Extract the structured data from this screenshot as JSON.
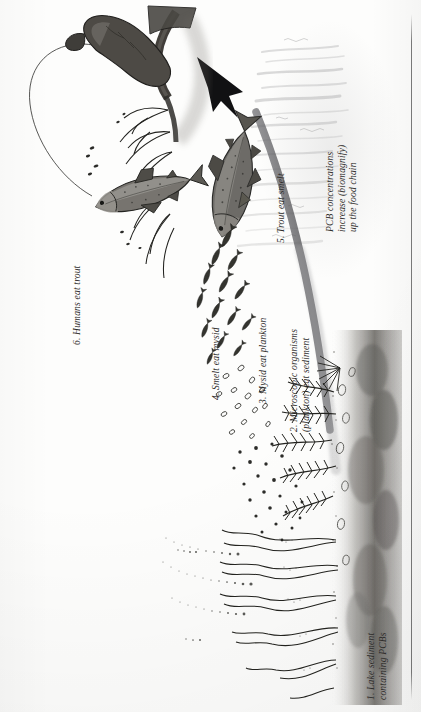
{
  "document": {
    "type": "book-page-illustration",
    "title": "PCB biomagnification in a lake food chain",
    "orientation": "sideways (text rotated 90 degrees counter-clockwise)",
    "background_color": "#fdfdfc",
    "ink_color": "#2b2b2b"
  },
  "labels": {
    "step1": {
      "line1": "1. Lake sediment",
      "line2": "containing PCBs"
    },
    "step2": {
      "line1": "2. Microscopic organisms",
      "line2": "(plankton) eat sediment"
    },
    "step3": "3. Mysid eat plankton",
    "step4": "4. Smelt eat mysid",
    "step5": "5. Trout eat smelt",
    "step6": "6. Humans eat trout",
    "biomagnify": {
      "line1": "PCB concentrations",
      "line2": "increase (biomagnify)",
      "line3": "up the food chain"
    }
  },
  "scene": {
    "elements": [
      "fishing-hand-and-rod",
      "hooked-trout-splashing",
      "water-splash",
      "trout",
      "school-of-smelt",
      "mysid-shrimp",
      "plankton-dots",
      "aquatic-plants",
      "lake-sediment-layer",
      "upward-arrow"
    ],
    "arrow": {
      "name": "biomagnification-arrow",
      "direction": "up-left",
      "meaning": "PCB concentration increases up the food chain"
    }
  }
}
